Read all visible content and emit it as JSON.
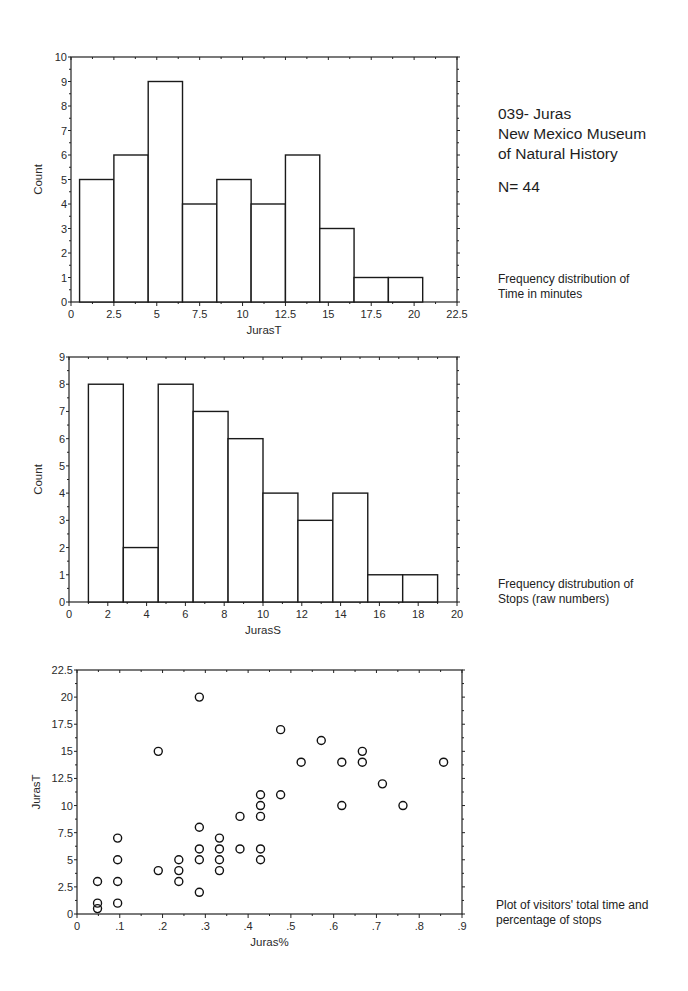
{
  "header": {
    "line1": "039- Juras",
    "line2": "New Mexico Museum",
    "line3": "of Natural History",
    "n_label": "N= 44"
  },
  "captions": {
    "time": [
      "Frequency distribution of",
      "Time in minutes"
    ],
    "stops": [
      "Frequency distrubution of",
      "Stops (raw numbers)"
    ],
    "scatter": [
      "Plot of visitors' total time and",
      "percentage of stops"
    ]
  },
  "chart_data": [
    {
      "type": "bar",
      "title": "",
      "xlabel": "JurasT",
      "ylabel": "Count",
      "xlim": [
        0,
        22.5
      ],
      "ylim": [
        0,
        10
      ],
      "xticks": [
        "0",
        "2.5",
        "5",
        "7.5",
        "10",
        "12.5",
        "15",
        "17.5",
        "20",
        "22.5"
      ],
      "yticks": [
        "0",
        "1",
        "2",
        "3",
        "4",
        "5",
        "6",
        "7",
        "8",
        "9",
        "10"
      ],
      "bin_edges": [
        0.5,
        2.5,
        4.5,
        6.5,
        8.5,
        10.5,
        12.5,
        14.5,
        16.5,
        18.5,
        20.5
      ],
      "values": [
        5,
        6,
        9,
        4,
        5,
        4,
        6,
        3,
        1,
        1
      ],
      "grid": false
    },
    {
      "type": "bar",
      "title": "",
      "xlabel": "JurasS",
      "ylabel": "Count",
      "xlim": [
        0,
        20
      ],
      "ylim": [
        0,
        9
      ],
      "xticks": [
        "0",
        "2",
        "4",
        "6",
        "8",
        "10",
        "12",
        "14",
        "16",
        "18",
        "20"
      ],
      "yticks": [
        "0",
        "1",
        "2",
        "3",
        "4",
        "5",
        "6",
        "7",
        "8",
        "9"
      ],
      "bin_edges": [
        1,
        2.8,
        4.6,
        6.4,
        8.2,
        10,
        11.8,
        13.6,
        15.4,
        17.2,
        19
      ],
      "values": [
        8,
        2,
        8,
        7,
        6,
        4,
        3,
        4,
        1,
        1
      ],
      "grid": false
    },
    {
      "type": "scatter",
      "title": "",
      "xlabel": "Juras%",
      "ylabel": "JurasT",
      "xlim": [
        0,
        0.9
      ],
      "ylim": [
        0,
        22.5
      ],
      "xticks": [
        "0",
        ".1",
        ".2",
        ".3",
        ".4",
        ".5",
        ".6",
        ".7",
        ".8",
        ".9"
      ],
      "yticks": [
        "0",
        "2.5",
        "5",
        "7.5",
        "10",
        "12.5",
        "15",
        "17.5",
        "20",
        "22.5"
      ],
      "points": [
        [
          0.048,
          3
        ],
        [
          0.048,
          1
        ],
        [
          0.048,
          0.5
        ],
        [
          0.095,
          7
        ],
        [
          0.095,
          5
        ],
        [
          0.095,
          3
        ],
        [
          0.095,
          1
        ],
        [
          0.19,
          15
        ],
        [
          0.19,
          4
        ],
        [
          0.238,
          5
        ],
        [
          0.238,
          4
        ],
        [
          0.238,
          3
        ],
        [
          0.286,
          20
        ],
        [
          0.286,
          8
        ],
        [
          0.286,
          6
        ],
        [
          0.286,
          5
        ],
        [
          0.286,
          2
        ],
        [
          0.333,
          7
        ],
        [
          0.333,
          6
        ],
        [
          0.333,
          5
        ],
        [
          0.333,
          4
        ],
        [
          0.381,
          9
        ],
        [
          0.381,
          6
        ],
        [
          0.429,
          11
        ],
        [
          0.429,
          10
        ],
        [
          0.429,
          9
        ],
        [
          0.429,
          6
        ],
        [
          0.429,
          5
        ],
        [
          0.476,
          17
        ],
        [
          0.476,
          11
        ],
        [
          0.524,
          14
        ],
        [
          0.571,
          16
        ],
        [
          0.619,
          14
        ],
        [
          0.619,
          10
        ],
        [
          0.667,
          15
        ],
        [
          0.667,
          14
        ],
        [
          0.714,
          12
        ],
        [
          0.762,
          10
        ],
        [
          0.857,
          14
        ]
      ],
      "marker": "open-circle",
      "grid": false
    }
  ]
}
